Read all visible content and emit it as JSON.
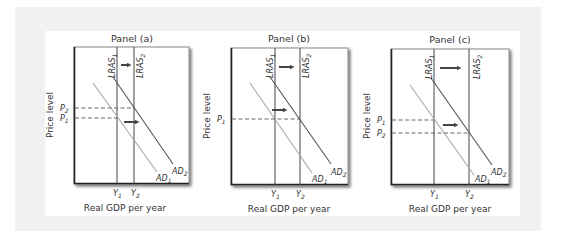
{
  "figure": {
    "type": "economics-diagram",
    "y_axis_label": "Price level",
    "x_axis_label": "Real GDP per year",
    "colors": {
      "frame": "#f1f1f1",
      "axis": "#222222",
      "lras": "#444444",
      "ad1": "#a8a8a8",
      "ad2": "#555555",
      "arrow": "#444444",
      "dash": "#555555"
    }
  },
  "panels": [
    {
      "title": "Panel (a)",
      "lras1_label": "LRAS",
      "lras1_sub": "1",
      "lras2_label": "LRAS",
      "lras2_sub": "2",
      "ad1_label": "AD",
      "ad1_sub": "1",
      "ad2_label": "AD",
      "ad2_sub": "2",
      "y1_label": "Y",
      "y1_sub": "1",
      "y2_label": "Y",
      "y2_sub": "2",
      "price_labels": [
        {
          "label": "P",
          "sub": "2"
        },
        {
          "label": "P",
          "sub": "1"
        }
      ],
      "outcome": "Price level rises (AD shifts more than LRAS)"
    },
    {
      "title": "Panel (b)",
      "lras1_label": "LRAS",
      "lras1_sub": "1",
      "lras2_label": "LRAS",
      "lras2_sub": "2",
      "ad1_label": "AD",
      "ad1_sub": "1",
      "ad2_label": "AD",
      "ad2_sub": "2",
      "y1_label": "Y",
      "y1_sub": "1",
      "y2_label": "Y",
      "y2_sub": "2",
      "price_labels": [
        {
          "label": "P",
          "sub": "1"
        }
      ],
      "outcome": "Price level unchanged (AD and LRAS shift equally)"
    },
    {
      "title": "Panel (c)",
      "lras1_label": "LRAS",
      "lras1_sub": "1",
      "lras2_label": "LRAS",
      "lras2_sub": "2",
      "ad1_label": "AD",
      "ad1_sub": "1",
      "ad2_label": "AD",
      "ad2_sub": "2",
      "y1_label": "Y",
      "y1_sub": "1",
      "y2_label": "Y",
      "y2_sub": "2",
      "price_labels": [
        {
          "label": "P",
          "sub": "1"
        },
        {
          "label": "P",
          "sub": "2"
        }
      ],
      "outcome": "Price level falls (LRAS shifts more than AD)"
    }
  ]
}
